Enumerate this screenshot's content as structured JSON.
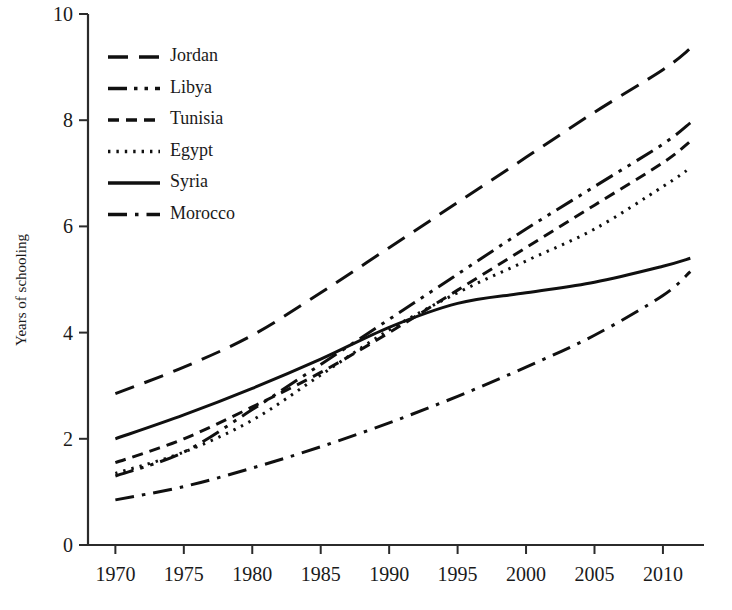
{
  "chart_data": {
    "type": "line",
    "title": "",
    "subtitle": "",
    "xlabel": "",
    "ylabel": "Years of schooling",
    "xlim": [
      1968,
      2013
    ],
    "ylim": [
      0,
      10
    ],
    "xticks": [
      1970,
      1975,
      1980,
      1985,
      1990,
      1995,
      2000,
      2005,
      2010
    ],
    "yticks": [
      0,
      2,
      4,
      6,
      8,
      10
    ],
    "grid": false,
    "legend_position": "top-left",
    "x": [
      1970,
      1975,
      1980,
      1985,
      1990,
      1995,
      2000,
      2005,
      2010,
      2012
    ],
    "series": [
      {
        "name": "Jordan",
        "dash": "long-dash",
        "values": [
          2.85,
          3.35,
          3.95,
          4.75,
          5.6,
          6.45,
          7.3,
          8.15,
          8.95,
          9.35
        ]
      },
      {
        "name": "Libya",
        "dash": "dash-dot-dot",
        "values": [
          1.3,
          1.75,
          2.55,
          3.4,
          4.25,
          5.1,
          5.95,
          6.75,
          7.55,
          7.95
        ]
      },
      {
        "name": "Tunisia",
        "dash": "dash",
        "values": [
          1.55,
          2.0,
          2.6,
          3.25,
          4.0,
          4.8,
          5.6,
          6.4,
          7.2,
          7.6
        ]
      },
      {
        "name": "Egypt",
        "dash": "dotted",
        "values": [
          1.35,
          1.75,
          2.35,
          3.2,
          4.05,
          4.75,
          5.35,
          5.95,
          6.75,
          7.1
        ]
      },
      {
        "name": "Syria",
        "dash": "solid",
        "values": [
          2.0,
          2.45,
          2.95,
          3.5,
          4.1,
          4.55,
          4.75,
          4.95,
          5.25,
          5.4
        ]
      },
      {
        "name": "Morocco",
        "dash": "dash-dot",
        "values": [
          0.85,
          1.1,
          1.45,
          1.85,
          2.3,
          2.8,
          3.35,
          3.95,
          4.7,
          5.15
        ]
      }
    ]
  },
  "legend": {
    "items": [
      {
        "label": "Jordan"
      },
      {
        "label": "Libya"
      },
      {
        "label": "Tunisia"
      },
      {
        "label": "Egypt"
      },
      {
        "label": "Syria"
      },
      {
        "label": "Morocco"
      }
    ]
  },
  "axes": {
    "y_title": "Years of schooling",
    "y_tick_labels": [
      "10",
      "8",
      "6",
      "4",
      "2",
      "0"
    ],
    "x_tick_labels": [
      "1970",
      "1975",
      "1980",
      "1985",
      "1990",
      "1995",
      "2000",
      "2005",
      "2010"
    ]
  }
}
